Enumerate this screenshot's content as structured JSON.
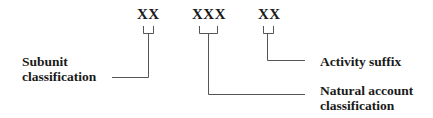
{
  "diagram": {
    "segments": [
      {
        "code": "XX",
        "label_lines": [
          "Subunit",
          "classification"
        ]
      },
      {
        "code": "XXX",
        "label_lines": [
          "Natural account",
          "classification"
        ]
      },
      {
        "code": "XX",
        "label_lines": [
          "Activity suffix"
        ]
      }
    ],
    "colors": {
      "text": "#1a1a1a",
      "line": "#555555",
      "background": "#ffffff"
    }
  }
}
